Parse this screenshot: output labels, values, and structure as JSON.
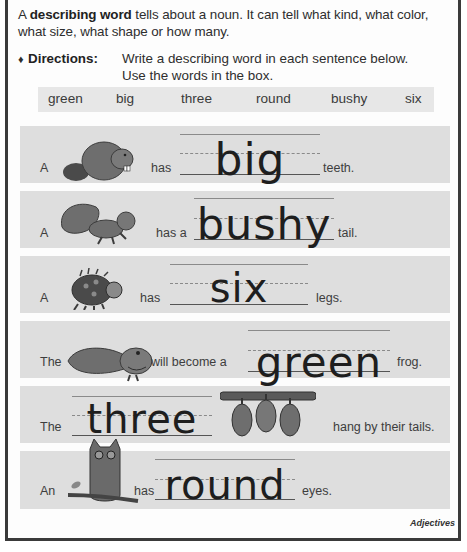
{
  "intro": {
    "prefix": "A ",
    "term": "describing word",
    "suffix": " tells about a noun. It can tell what kind, what color, what size, what shape or how many."
  },
  "directions": {
    "bullet": "♦",
    "label": "Directions:",
    "line1": "Write a describing word in each sentence below.",
    "line2": "Use the words in the box."
  },
  "word_box": [
    "green",
    "big",
    "three",
    "round",
    "bushy",
    "six"
  ],
  "sentences": [
    {
      "before": "A",
      "picture": "beaver",
      "middle": "has",
      "answer": "big",
      "after": "teeth."
    },
    {
      "before": "A",
      "picture": "squirrel",
      "middle": "has a",
      "answer": "bushy",
      "after": "tail."
    },
    {
      "before": "A",
      "picture": "ladybug",
      "middle": "has",
      "answer": "six",
      "after": "legs."
    },
    {
      "before": "The",
      "picture": "tadpole",
      "middle": "will become a",
      "answer": "green",
      "after": "frog."
    },
    {
      "before": "The",
      "answer": "three",
      "picture": "opossums",
      "after": "hang by their tails."
    },
    {
      "before": "An",
      "picture": "owl",
      "middle": "has",
      "answer": "round",
      "after": "eyes."
    }
  ],
  "footer": "Adjectives"
}
